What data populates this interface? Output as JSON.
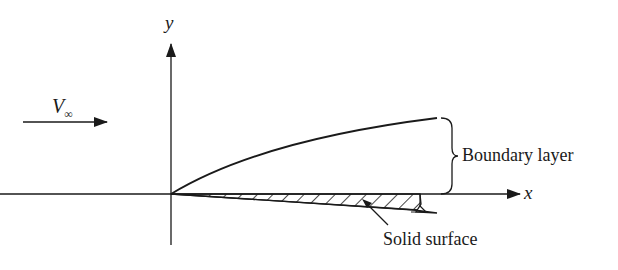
{
  "diagram": {
    "labels": {
      "y_axis": "y",
      "x_axis": "x",
      "freestream": "V",
      "freestream_sub": "∞",
      "boundary_layer": "Boundary layer",
      "solid_surface": "Solid surface"
    },
    "colors": {
      "line": "#1a1a1a",
      "background": "#ffffff"
    }
  }
}
